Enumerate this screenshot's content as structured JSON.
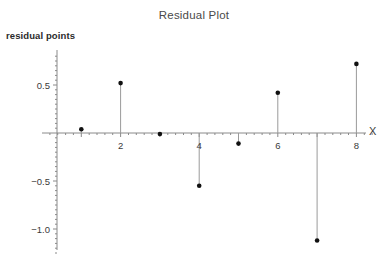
{
  "chart_data": {
    "type": "scatter",
    "title": "Residual Plot",
    "xlabel": "X",
    "ylabel": "residual points",
    "style": "stem",
    "x": [
      1,
      2,
      3,
      4,
      5,
      6,
      7,
      8
    ],
    "values": [
      0.04,
      0.52,
      -0.01,
      -0.55,
      -0.11,
      0.42,
      -1.12,
      0.72
    ],
    "series": [
      {
        "name": "residuals",
        "values": [
          0.04,
          0.52,
          -0.01,
          -0.55,
          -0.11,
          0.42,
          -1.12,
          0.72
        ]
      }
    ],
    "xlim": [
      0,
      8.6
    ],
    "ylim": [
      -1.3,
      0.88
    ],
    "xticks": [
      1,
      2,
      3,
      4,
      5,
      6,
      7,
      8
    ],
    "xtick_labels": [
      "",
      "2",
      "",
      "4",
      "",
      "6",
      "",
      "8"
    ],
    "yticks": [
      0.5,
      -0.5,
      -1.0
    ],
    "ytick_labels": [
      "0.5",
      "-0.5",
      "-1.0"
    ],
    "grid": false,
    "legend": null,
    "baseline": 0,
    "marker_color": "#111111",
    "axis_color": "#8a8a8a",
    "stem_color": "#9a9a9a"
  },
  "labels": {
    "title": "Residual Plot",
    "y_axis_label": "residual points",
    "x_axis_label": "X",
    "ytick_0": "0.5",
    "ytick_1": "-0.5",
    "ytick_2": "-1.0",
    "xtick_2": "2",
    "xtick_4": "4",
    "xtick_6": "6",
    "xtick_8": "8"
  }
}
